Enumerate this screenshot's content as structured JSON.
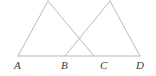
{
  "figure": {
    "type": "geometry-diagram",
    "canvas": {
      "width": 156,
      "height": 76
    },
    "style": {
      "background_color": "#ffffff",
      "line_color": "#b9b9b9",
      "line_width": 1,
      "label_color": "#3a3a3a",
      "label_font_style": "italic",
      "label_font_size": 11
    },
    "points": [
      {
        "id": "A",
        "label": "A",
        "x": 18,
        "y": 56,
        "label_x": 14,
        "label_y": 60
      },
      {
        "id": "B",
        "label": "B",
        "x": 65,
        "y": 56,
        "label_x": 61,
        "label_y": 60
      },
      {
        "id": "C",
        "label": "C",
        "x": 94,
        "y": 56,
        "label_x": 100,
        "label_y": 60
      },
      {
        "id": "D",
        "label": "D",
        "x": 140,
        "y": 56,
        "label_x": 136,
        "label_y": 60
      },
      {
        "id": "P",
        "label": "",
        "x": 48,
        "y": 1,
        "label_x": 0,
        "label_y": 0
      },
      {
        "id": "Q",
        "label": "",
        "x": 110,
        "y": 1,
        "label_x": 0,
        "label_y": 0
      }
    ],
    "segments": [
      {
        "id": "baseline-AD",
        "from": "A",
        "to": "D"
      },
      {
        "id": "side-AP",
        "from": "A",
        "to": "P"
      },
      {
        "id": "side-PC",
        "from": "P",
        "to": "C"
      },
      {
        "id": "side-BQ",
        "from": "B",
        "to": "Q"
      },
      {
        "id": "side-QD",
        "from": "Q",
        "to": "D"
      }
    ],
    "labels": [
      "A",
      "B",
      "C",
      "D"
    ]
  }
}
